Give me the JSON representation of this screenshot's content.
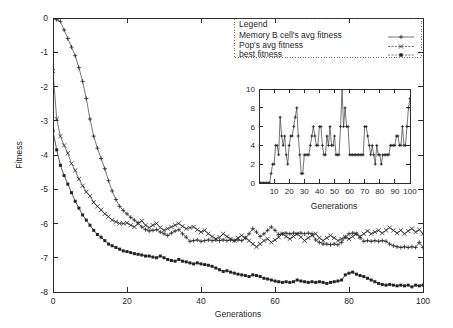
{
  "chart_data": [
    {
      "id": "main",
      "type": "line",
      "title": "",
      "xlabel": "Generations",
      "ylabel": "Fitness",
      "xlim": [
        0,
        100
      ],
      "ylim": [
        -8,
        0
      ],
      "xticks": [
        0,
        20,
        40,
        60,
        80,
        100
      ],
      "yticks": [
        0,
        -1,
        -2,
        -3,
        -4,
        -5,
        -6,
        -7,
        -8
      ],
      "xtick_labels": [
        "0",
        "20",
        "40",
        "60",
        "80",
        "100"
      ],
      "ytick_labels": [
        "0",
        "-1",
        "-2",
        "-3",
        "-4",
        "-5",
        "-6",
        "-7",
        "-8"
      ],
      "grid": false,
      "legend_position": "top-right",
      "legend_title": "Legend",
      "series": [
        {
          "name": "Memory B cell's avg fitness",
          "marker": "plus",
          "x": [
            0,
            1,
            2,
            3,
            4,
            5,
            6,
            7,
            8,
            9,
            10,
            11,
            12,
            13,
            14,
            15,
            16,
            17,
            18,
            19,
            20,
            21,
            22,
            23,
            24,
            25,
            26,
            27,
            28,
            29,
            30,
            31,
            32,
            33,
            34,
            35,
            36,
            37,
            38,
            39,
            40,
            41,
            42,
            43,
            44,
            45,
            46,
            47,
            48,
            49,
            50,
            51,
            52,
            53,
            54,
            55,
            56,
            57,
            58,
            59,
            60,
            61,
            62,
            63,
            64,
            65,
            66,
            67,
            68,
            69,
            70,
            71,
            72,
            73,
            74,
            75,
            76,
            77,
            78,
            79,
            80,
            81,
            82,
            83,
            84,
            85,
            86,
            87,
            88,
            89,
            90,
            91,
            92,
            93,
            94,
            95,
            96,
            97,
            98,
            99,
            100
          ],
          "y": [
            -0.02,
            -0.05,
            -0.1,
            -0.35,
            -0.6,
            -0.85,
            -1.1,
            -1.45,
            -1.85,
            -2.35,
            -2.95,
            -3.45,
            -3.8,
            -4.1,
            -4.4,
            -4.75,
            -5.05,
            -5.3,
            -5.5,
            -5.62,
            -5.72,
            -5.82,
            -5.9,
            -5.98,
            -6.1,
            -6.18,
            -6.22,
            -6.2,
            -6.18,
            -6.25,
            -6.3,
            -6.35,
            -6.28,
            -6.22,
            -6.18,
            -6.3,
            -6.4,
            -6.52,
            -6.5,
            -6.48,
            -6.52,
            -6.5,
            -6.48,
            -6.5,
            -6.48,
            -6.5,
            -6.48,
            -6.5,
            -6.48,
            -6.5,
            -6.48,
            -6.5,
            -6.42,
            -6.3,
            -6.15,
            -6.25,
            -6.38,
            -6.3,
            -6.2,
            -6.1,
            -6.2,
            -6.32,
            -6.3,
            -6.28,
            -6.3,
            -6.28,
            -6.3,
            -6.28,
            -6.3,
            -6.28,
            -6.3,
            -6.48,
            -6.55,
            -6.6,
            -6.6,
            -6.62,
            -6.6,
            -6.62,
            -6.55,
            -6.4,
            -6.3,
            -6.28,
            -6.3,
            -6.42,
            -6.52,
            -6.5,
            -6.52,
            -6.5,
            -6.52,
            -6.5,
            -6.52,
            -6.6,
            -6.65,
            -6.68,
            -6.7,
            -6.68,
            -6.7,
            -6.68,
            -6.7,
            -6.55,
            -6.7
          ]
        },
        {
          "name": "Pop's avg fitness",
          "marker": "cross",
          "x": [
            0,
            1,
            2,
            3,
            4,
            5,
            6,
            7,
            8,
            9,
            10,
            11,
            12,
            13,
            14,
            15,
            16,
            17,
            18,
            19,
            20,
            21,
            22,
            23,
            24,
            25,
            26,
            27,
            28,
            29,
            30,
            31,
            32,
            33,
            34,
            35,
            36,
            37,
            38,
            39,
            40,
            41,
            42,
            43,
            44,
            45,
            46,
            47,
            48,
            49,
            50,
            51,
            52,
            53,
            54,
            55,
            56,
            57,
            58,
            59,
            60,
            61,
            62,
            63,
            64,
            65,
            66,
            67,
            68,
            69,
            70,
            71,
            72,
            73,
            74,
            75,
            76,
            77,
            78,
            79,
            80,
            81,
            82,
            83,
            84,
            85,
            86,
            87,
            88,
            89,
            90,
            91,
            92,
            93,
            94,
            95,
            96,
            97,
            98,
            99,
            100
          ],
          "y": [
            -1.55,
            -2.95,
            -3.45,
            -3.72,
            -3.95,
            -4.25,
            -4.45,
            -4.7,
            -4.9,
            -5.08,
            -5.2,
            -5.38,
            -5.5,
            -5.6,
            -5.72,
            -5.8,
            -5.9,
            -5.95,
            -6.0,
            -6.0,
            -5.98,
            -6.05,
            -6.1,
            -6.0,
            -5.92,
            -6.05,
            -6.12,
            -6.05,
            -6.0,
            -6.12,
            -6.2,
            -6.15,
            -6.1,
            -6.05,
            -6.0,
            -6.08,
            -6.15,
            -6.12,
            -6.1,
            -6.18,
            -6.25,
            -6.2,
            -6.3,
            -6.38,
            -6.45,
            -6.4,
            -6.3,
            -6.38,
            -6.45,
            -6.5,
            -6.42,
            -6.35,
            -6.42,
            -6.5,
            -6.6,
            -6.68,
            -6.6,
            -6.5,
            -6.45,
            -6.55,
            -6.48,
            -6.4,
            -6.3,
            -6.38,
            -6.45,
            -6.38,
            -6.3,
            -6.4,
            -6.5,
            -6.42,
            -6.35,
            -6.3,
            -6.42,
            -6.5,
            -6.42,
            -6.35,
            -6.42,
            -6.5,
            -6.45,
            -6.4,
            -6.45,
            -6.38,
            -6.3,
            -6.38,
            -6.3,
            -6.22,
            -6.3,
            -6.25,
            -6.2,
            -6.28,
            -6.2,
            -6.12,
            -6.2,
            -6.28,
            -6.2,
            -6.3,
            -6.22,
            -6.15,
            -6.25,
            -6.18,
            -6.3
          ]
        },
        {
          "name": "best fitness",
          "marker": "filled-square",
          "x": [
            0,
            1,
            2,
            3,
            4,
            5,
            6,
            7,
            8,
            9,
            10,
            11,
            12,
            13,
            14,
            15,
            16,
            17,
            18,
            19,
            20,
            21,
            22,
            23,
            24,
            25,
            26,
            27,
            28,
            29,
            30,
            31,
            32,
            33,
            34,
            35,
            36,
            37,
            38,
            39,
            40,
            41,
            42,
            43,
            44,
            45,
            46,
            47,
            48,
            49,
            50,
            51,
            52,
            53,
            54,
            55,
            56,
            57,
            58,
            59,
            60,
            61,
            62,
            63,
            64,
            65,
            66,
            67,
            68,
            69,
            70,
            71,
            72,
            73,
            74,
            75,
            76,
            77,
            78,
            79,
            80,
            81,
            82,
            83,
            84,
            85,
            86,
            87,
            88,
            89,
            90,
            91,
            92,
            93,
            94,
            95,
            96,
            97,
            98,
            99,
            100
          ],
          "y": [
            -3.3,
            -3.85,
            -4.3,
            -4.6,
            -4.85,
            -5.1,
            -5.35,
            -5.55,
            -5.75,
            -5.9,
            -6.05,
            -6.2,
            -6.32,
            -6.4,
            -6.5,
            -6.6,
            -6.65,
            -6.7,
            -6.75,
            -6.8,
            -6.82,
            -6.85,
            -6.88,
            -6.9,
            -6.92,
            -6.95,
            -6.95,
            -6.98,
            -7.0,
            -6.95,
            -7.0,
            -7.05,
            -7.08,
            -7.1,
            -7.05,
            -7.1,
            -7.12,
            -7.15,
            -7.18,
            -7.15,
            -7.18,
            -7.2,
            -7.22,
            -7.25,
            -7.3,
            -7.35,
            -7.4,
            -7.38,
            -7.42,
            -7.45,
            -7.48,
            -7.5,
            -7.52,
            -7.55,
            -7.5,
            -7.52,
            -7.55,
            -7.6,
            -7.62,
            -7.65,
            -7.68,
            -7.7,
            -7.72,
            -7.7,
            -7.72,
            -7.7,
            -7.65,
            -7.68,
            -7.7,
            -7.72,
            -7.7,
            -7.72,
            -7.7,
            -7.72,
            -7.75,
            -7.72,
            -7.7,
            -7.68,
            -7.65,
            -7.5,
            -7.45,
            -7.42,
            -7.48,
            -7.52,
            -7.55,
            -7.6,
            -7.65,
            -7.7,
            -7.75,
            -7.78,
            -7.8,
            -7.78,
            -7.8,
            -7.82,
            -7.8,
            -7.82,
            -7.8,
            -7.85,
            -7.8,
            -7.82,
            -7.8
          ]
        }
      ]
    },
    {
      "id": "inset",
      "type": "line",
      "title": "",
      "xlabel": "Generations",
      "ylabel": "",
      "xlim": [
        0,
        100
      ],
      "ylim": [
        0,
        10
      ],
      "xticks": [
        10,
        20,
        30,
        40,
        50,
        60,
        70,
        80,
        90,
        100
      ],
      "yticks": [
        0,
        2,
        4,
        6,
        8,
        10
      ],
      "xtick_labels": [
        "10",
        "20",
        "30",
        "40",
        "50",
        "60",
        "70",
        "80",
        "90",
        "100"
      ],
      "ytick_labels": [
        "0",
        "2",
        "4",
        "6",
        "8",
        "10"
      ],
      "grid": false,
      "series": [
        {
          "name": "memory cells",
          "marker": "plus",
          "x": [
            0,
            1,
            2,
            3,
            4,
            5,
            6,
            7,
            8,
            9,
            10,
            11,
            12,
            13,
            14,
            15,
            16,
            17,
            18,
            19,
            20,
            21,
            22,
            23,
            24,
            25,
            26,
            27,
            28,
            29,
            30,
            31,
            32,
            33,
            34,
            35,
            36,
            37,
            38,
            39,
            40,
            41,
            42,
            43,
            44,
            45,
            46,
            47,
            48,
            49,
            50,
            51,
            52,
            53,
            54,
            55,
            56,
            57,
            58,
            59,
            60,
            61,
            62,
            63,
            64,
            65,
            66,
            67,
            68,
            69,
            70,
            71,
            72,
            73,
            74,
            75,
            76,
            77,
            78,
            79,
            80,
            81,
            82,
            83,
            84,
            85,
            86,
            87,
            88,
            89,
            90,
            91,
            92,
            93,
            94,
            95,
            96,
            97,
            98,
            99,
            100
          ],
          "y": [
            0,
            0,
            0,
            0,
            0,
            0,
            0,
            0,
            1,
            2,
            2,
            4,
            4,
            3,
            7,
            5,
            4,
            5,
            3,
            2,
            4,
            5,
            5,
            6,
            7,
            8,
            5,
            3,
            1,
            1,
            3,
            3,
            3,
            3,
            4,
            5,
            6,
            5,
            4,
            4,
            6,
            6,
            4,
            3,
            3,
            5,
            4,
            6,
            4,
            4,
            5,
            3,
            3,
            3,
            6,
            10,
            6,
            8,
            6,
            6,
            3,
            3,
            3,
            3,
            3,
            3,
            3,
            3,
            3,
            3,
            6,
            6,
            5,
            4,
            3,
            4,
            3,
            2,
            4,
            3,
            3,
            2,
            3,
            3,
            3,
            3,
            3,
            4,
            4,
            4,
            4,
            5,
            5,
            4,
            4,
            6,
            4,
            4,
            6,
            8,
            9
          ]
        }
      ]
    }
  ],
  "legend": {
    "title": "Legend",
    "entries": [
      {
        "label": "Memory B cell's avg fitness",
        "marker": "plus"
      },
      {
        "label": "Pop's avg fitness",
        "marker": "cross"
      },
      {
        "label": "best fitness",
        "marker": "filled-square"
      }
    ]
  },
  "axes": {
    "main": {
      "ylabel": "Fitness",
      "xlabel": "Generations"
    },
    "inset": {
      "xlabel": "Generations"
    }
  }
}
